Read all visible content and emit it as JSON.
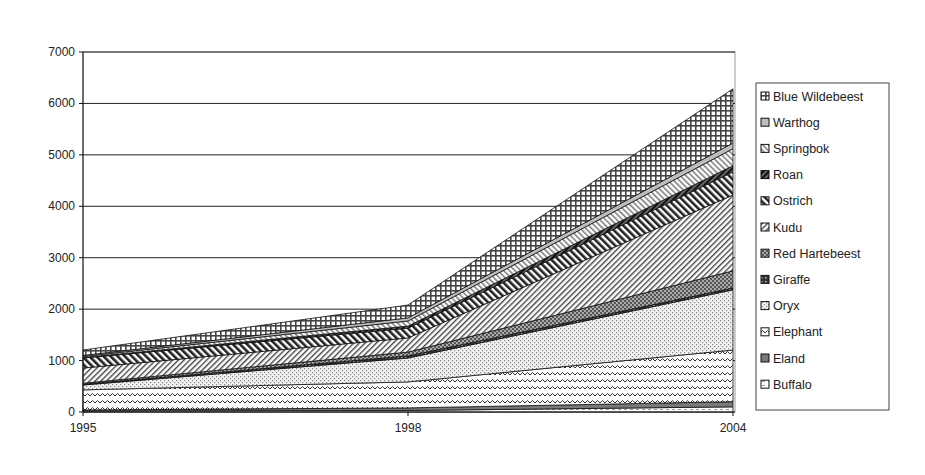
{
  "chart_data": {
    "type": "area",
    "stacked": true,
    "title": "",
    "xlabel": "",
    "ylabel": "",
    "categories": [
      "1995",
      "1998",
      "2004"
    ],
    "ylim": [
      0,
      7000
    ],
    "yticks": [
      0,
      1000,
      2000,
      3000,
      4000,
      5000,
      6000,
      7000
    ],
    "grid": true,
    "legend_position": "right",
    "series": [
      {
        "name": "Buffalo",
        "values": [
          20,
          30,
          100
        ],
        "pattern": "buffalo"
      },
      {
        "name": "Eland",
        "values": [
          20,
          50,
          100
        ],
        "pattern": "eland"
      },
      {
        "name": "Elephant",
        "values": [
          390,
          505,
          1005
        ],
        "pattern": "elephant"
      },
      {
        "name": "Oryx",
        "values": [
          95,
          465,
          1170
        ],
        "pattern": "oryx"
      },
      {
        "name": "Giraffe",
        "values": [
          15,
          40,
          35
        ],
        "pattern": "giraffe"
      },
      {
        "name": "Red Hartebeest",
        "values": [
          20,
          75,
          335
        ],
        "pattern": "redhart"
      },
      {
        "name": "Kudu",
        "values": [
          295,
          275,
          1475
        ],
        "pattern": "kudu"
      },
      {
        "name": "Ostrich",
        "values": [
          195,
          190,
          450
        ],
        "pattern": "ostrich"
      },
      {
        "name": "Roan",
        "values": [
          10,
          40,
          120
        ],
        "pattern": "roan"
      },
      {
        "name": "Springbok",
        "values": [
          20,
          100,
          330
        ],
        "pattern": "springbok"
      },
      {
        "name": "Warthog",
        "values": [
          20,
          60,
          110
        ],
        "pattern": "warthog"
      },
      {
        "name": "Blue Wildebeest",
        "values": [
          105,
          250,
          1055
        ],
        "pattern": "bluewild"
      }
    ],
    "legend_order": [
      "Blue Wildebeest",
      "Warthog",
      "Springbok",
      "Roan",
      "Ostrich",
      "Kudu",
      "Red Hartebeest",
      "Giraffe",
      "Oryx",
      "Elephant",
      "Eland",
      "Buffalo"
    ]
  }
}
